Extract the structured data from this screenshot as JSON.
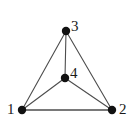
{
  "figure": {
    "name": "graph-diagram",
    "type": "undirected-graph",
    "background_color": "#ffffff",
    "edge_color": "#4d4d4d",
    "node_color": "#111111",
    "label_color": "#1a1a1a",
    "width": 133,
    "height": 126
  },
  "nodes": [
    {
      "id": "1",
      "label": "1",
      "x": 22,
      "y": 110,
      "r": 4.2,
      "label_x": 7,
      "label_y": 102
    },
    {
      "id": "2",
      "label": "2",
      "x": 112,
      "y": 110,
      "r": 4.2,
      "label_x": 119,
      "label_y": 102
    },
    {
      "id": "3",
      "label": "3",
      "x": 66,
      "y": 31,
      "r": 4.2,
      "label_x": 71,
      "label_y": 19
    },
    {
      "id": "4",
      "label": "4",
      "x": 65,
      "y": 78,
      "r": 4.2,
      "label_x": 70,
      "label_y": 66
    }
  ],
  "edges": [
    {
      "id": "e-1-2",
      "from": "1",
      "to": "2",
      "width": 1.6
    },
    {
      "id": "e-1-3",
      "from": "1",
      "to": "3",
      "width": 1.1
    },
    {
      "id": "e-1-4",
      "from": "1",
      "to": "4",
      "width": 1.1
    },
    {
      "id": "e-2-3",
      "from": "2",
      "to": "3",
      "width": 1.1
    },
    {
      "id": "e-2-4",
      "from": "2",
      "to": "4",
      "width": 1.1
    },
    {
      "id": "e-3-4",
      "from": "3",
      "to": "4",
      "width": 1.1
    }
  ]
}
